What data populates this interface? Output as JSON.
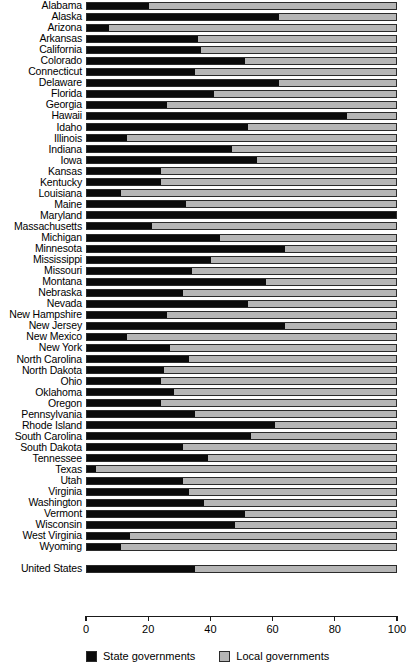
{
  "chart_data": {
    "type": "bar",
    "orientation": "horizontal",
    "stacked": true,
    "title": "",
    "subtitle": "",
    "xlabel": "",
    "ylabel": "",
    "xlim": [
      0,
      100
    ],
    "xticks": [
      0,
      20,
      40,
      60,
      80,
      100
    ],
    "xtick_labels": [
      "0",
      "20",
      "40",
      "60",
      "80",
      "100"
    ],
    "grid": false,
    "legend_position": "bottom",
    "legend": [
      {
        "name": "State governments",
        "color": "#0b0b0b",
        "swatch": "state"
      },
      {
        "name": "Local governments",
        "color": "#b6b6b6",
        "swatch": "local"
      }
    ],
    "series": [
      {
        "name": "State governments",
        "color": "#0b0b0b"
      },
      {
        "name": "Local governments",
        "color": "#b6b6b6"
      }
    ],
    "categories": [
      "Alabama",
      "Alaska",
      "Arizona",
      "Arkansas",
      "California",
      "Colorado",
      "Connecticut",
      "Delaware",
      "Florida",
      "Georgia",
      "Hawaii",
      "Idaho",
      "Illinois",
      "Indiana",
      "Iowa",
      "Kansas",
      "Kentucky",
      "Louisiana",
      "Maine",
      "Maryland",
      "Massachusetts",
      "Michigan",
      "Minnesota",
      "Mississippi",
      "Missouri",
      "Montana",
      "Nebraska",
      "Nevada",
      "New Hampshire",
      "New Jersey",
      "New Mexico",
      "New York",
      "North Carolina",
      "North Dakota",
      "Ohio",
      "Oklahoma",
      "Oregon",
      "Pennsylvania",
      "Rhode Island",
      "South Carolina",
      "South Dakota",
      "Tennessee",
      "Texas",
      "Utah",
      "Virginia",
      "Washington",
      "Vermont",
      "Wisconsin",
      "West Virginia",
      "Wyoming",
      "",
      "United States"
    ],
    "rows": [
      {
        "label": "Alabama",
        "state": 20,
        "local": 80,
        "spacer": false
      },
      {
        "label": "Alaska",
        "state": 62,
        "local": 38,
        "spacer": false
      },
      {
        "label": "Arizona",
        "state": 7,
        "local": 93,
        "spacer": false
      },
      {
        "label": "Arkansas",
        "state": 36,
        "local": 64,
        "spacer": false
      },
      {
        "label": "California",
        "state": 37,
        "local": 63,
        "spacer": false
      },
      {
        "label": "Colorado",
        "state": 51,
        "local": 49,
        "spacer": false
      },
      {
        "label": "Connecticut",
        "state": 35,
        "local": 65,
        "spacer": false
      },
      {
        "label": "Delaware",
        "state": 62,
        "local": 38,
        "spacer": false
      },
      {
        "label": "Florida",
        "state": 41,
        "local": 59,
        "spacer": false
      },
      {
        "label": "Georgia",
        "state": 26,
        "local": 74,
        "spacer": false
      },
      {
        "label": "Hawaii",
        "state": 84,
        "local": 16,
        "spacer": false
      },
      {
        "label": "Idaho",
        "state": 52,
        "local": 48,
        "spacer": false
      },
      {
        "label": "Illinois",
        "state": 13,
        "local": 87,
        "spacer": false
      },
      {
        "label": "Indiana",
        "state": 47,
        "local": 53,
        "spacer": false
      },
      {
        "label": "Iowa",
        "state": 55,
        "local": 45,
        "spacer": false
      },
      {
        "label": "Kansas",
        "state": 24,
        "local": 76,
        "spacer": false
      },
      {
        "label": "Kentucky",
        "state": 24,
        "local": 76,
        "spacer": false
      },
      {
        "label": "Louisiana",
        "state": 11,
        "local": 89,
        "spacer": false
      },
      {
        "label": "Maine",
        "state": 32,
        "local": 68,
        "spacer": false
      },
      {
        "label": "Maryland",
        "state": 100,
        "local": 0,
        "spacer": false
      },
      {
        "label": "Massachusetts",
        "state": 21,
        "local": 79,
        "spacer": false
      },
      {
        "label": "Michigan",
        "state": 43,
        "local": 57,
        "spacer": false
      },
      {
        "label": "Minnesota",
        "state": 64,
        "local": 36,
        "spacer": false
      },
      {
        "label": "Mississippi",
        "state": 40,
        "local": 60,
        "spacer": false
      },
      {
        "label": "Missouri",
        "state": 34,
        "local": 66,
        "spacer": false
      },
      {
        "label": "Montana",
        "state": 58,
        "local": 42,
        "spacer": false
      },
      {
        "label": "Nebraska",
        "state": 31,
        "local": 69,
        "spacer": false
      },
      {
        "label": "Nevada",
        "state": 52,
        "local": 48,
        "spacer": false
      },
      {
        "label": "New Hampshire",
        "state": 26,
        "local": 74,
        "spacer": false
      },
      {
        "label": "New Jersey",
        "state": 64,
        "local": 36,
        "spacer": false
      },
      {
        "label": "New Mexico",
        "state": 13,
        "local": 87,
        "spacer": false
      },
      {
        "label": "New York",
        "state": 27,
        "local": 73,
        "spacer": false
      },
      {
        "label": "North Carolina",
        "state": 33,
        "local": 67,
        "spacer": false
      },
      {
        "label": "North Dakota",
        "state": 25,
        "local": 75,
        "spacer": false
      },
      {
        "label": "Ohio",
        "state": 24,
        "local": 76,
        "spacer": false
      },
      {
        "label": "Oklahoma",
        "state": 28,
        "local": 72,
        "spacer": false
      },
      {
        "label": "Oregon",
        "state": 24,
        "local": 76,
        "spacer": false
      },
      {
        "label": "Pennsylvania",
        "state": 35,
        "local": 65,
        "spacer": false
      },
      {
        "label": "Rhode Island",
        "state": 61,
        "local": 39,
        "spacer": false
      },
      {
        "label": "South Carolina",
        "state": 53,
        "local": 47,
        "spacer": false
      },
      {
        "label": "South Dakota",
        "state": 31,
        "local": 69,
        "spacer": false
      },
      {
        "label": "Tennessee",
        "state": 39,
        "local": 61,
        "spacer": false
      },
      {
        "label": "Texas",
        "state": 3,
        "local": 97,
        "spacer": false
      },
      {
        "label": "Utah",
        "state": 31,
        "local": 69,
        "spacer": false
      },
      {
        "label": "Virginia",
        "state": 33,
        "local": 67,
        "spacer": false
      },
      {
        "label": "Washington",
        "state": 38,
        "local": 62,
        "spacer": false
      },
      {
        "label": "Vermont",
        "state": 51,
        "local": 49,
        "spacer": false
      },
      {
        "label": "Wisconsin",
        "state": 48,
        "local": 52,
        "spacer": false
      },
      {
        "label": "West Virginia",
        "state": 14,
        "local": 86,
        "spacer": false
      },
      {
        "label": "Wyoming",
        "state": 11,
        "local": 89,
        "spacer": false
      },
      {
        "label": "",
        "state": 0,
        "local": 0,
        "spacer": true
      },
      {
        "label": "United States",
        "state": 35,
        "local": 65,
        "spacer": false
      }
    ]
  },
  "axis": {
    "ticks": [
      {
        "value": 0,
        "label": "0"
      },
      {
        "value": 20,
        "label": "20"
      },
      {
        "value": 40,
        "label": "40"
      },
      {
        "value": 60,
        "label": "60"
      },
      {
        "value": 80,
        "label": "80"
      },
      {
        "value": 100,
        "label": "100"
      }
    ]
  },
  "legend": {
    "items": [
      {
        "label": "State governments",
        "swatch": "state"
      },
      {
        "label": "Local governments",
        "swatch": "local"
      }
    ]
  },
  "colors": {
    "state": "#0b0b0b",
    "local": "#b6b6b6",
    "axis": "#1a1a1a",
    "background": "#ffffff"
  }
}
